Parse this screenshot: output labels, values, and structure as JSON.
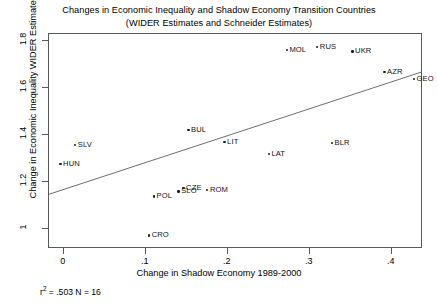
{
  "chart_data": {
    "type": "scatter",
    "title": "Changes in Economic Inequality and Shadow Economy Transition Countries",
    "subtitle": "(WIDER Estimates and Schneider Estimates)",
    "xlabel": "Change in Shadow Economy 1989-2000",
    "ylabel": "Change in Economic Inequality WIDER Estimates",
    "xlim": [
      -0.018,
      0.438
    ],
    "ylim": [
      0.915,
      1.83
    ],
    "xticks": [
      0,
      0.1,
      0.2,
      0.3,
      0.4
    ],
    "xtick_labels": [
      "0",
      ".1",
      ".2",
      ".3",
      ".4"
    ],
    "yticks": [
      1.0,
      1.2,
      1.4,
      1.6,
      1.8
    ],
    "ytick_labels": [
      "1",
      "1.2",
      "1.4",
      "1.6",
      "1.8"
    ],
    "grid": false,
    "legend": null,
    "annotation": "r² = .503 N = 16",
    "r_squared": 0.503,
    "n": 16,
    "fit_line": {
      "x": [
        -0.018,
        0.436
      ],
      "y": [
        1.148,
        1.668
      ]
    },
    "points": [
      {
        "label": "HUN",
        "x": -0.004,
        "y": 1.276,
        "label_pos": "right"
      },
      {
        "label": "SLV",
        "x": 0.014,
        "y": 1.357,
        "label_pos": "right"
      },
      {
        "label": "CRO",
        "x": 0.104,
        "y": 0.972,
        "label_pos": "right"
      },
      {
        "label": "POL",
        "x": 0.11,
        "y": 1.139,
        "label_pos": "right"
      },
      {
        "label": "SLO",
        "x": 0.14,
        "y": 1.16,
        "label_pos": "right"
      },
      {
        "label": "CZE",
        "x": 0.146,
        "y": 1.174,
        "label_pos": "right"
      },
      {
        "label": "BUL",
        "x": 0.152,
        "y": 1.421,
        "label_pos": "right"
      },
      {
        "label": "ROM",
        "x": 0.175,
        "y": 1.165,
        "label_pos": "right"
      },
      {
        "label": "LIT",
        "x": 0.196,
        "y": 1.37,
        "label_pos": "right"
      },
      {
        "label": "LAT",
        "x": 0.25,
        "y": 1.318,
        "label_pos": "right"
      },
      {
        "label": "MOL",
        "x": 0.272,
        "y": 1.762,
        "label_pos": "right"
      },
      {
        "label": "RUS",
        "x": 0.309,
        "y": 1.775,
        "label_pos": "right"
      },
      {
        "label": "BLR",
        "x": 0.327,
        "y": 1.365,
        "label_pos": "right"
      },
      {
        "label": "UKR",
        "x": 0.352,
        "y": 1.755,
        "label_pos": "right"
      },
      {
        "label": "AZR",
        "x": 0.391,
        "y": 1.669,
        "label_pos": "right"
      },
      {
        "label": "GEO",
        "x": 0.427,
        "y": 1.639,
        "label_pos": "right"
      }
    ]
  }
}
